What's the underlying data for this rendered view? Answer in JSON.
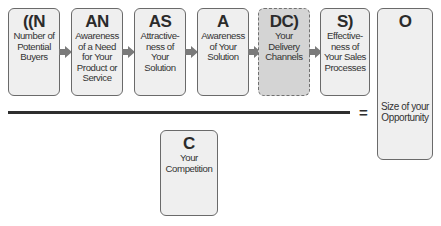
{
  "diagram": {
    "factors": [
      {
        "code": "((N",
        "desc": "Number of Potential Buyers",
        "style": "solid"
      },
      {
        "code": "AN",
        "desc": "Awareness of a Need for Your Product or Service",
        "style": "solid"
      },
      {
        "code": "AS",
        "desc": "Attractive-ness of Your Solution",
        "style": "solid"
      },
      {
        "code": "A",
        "desc": "Awareness of Your Solution",
        "style": "solid"
      },
      {
        "code": "DC)",
        "desc": "Your Delivery Channels",
        "style": "dashed"
      },
      {
        "code": "S)",
        "desc": "Effective-ness of Your Sales Processes",
        "style": "solid"
      }
    ],
    "result": {
      "code": "O",
      "desc": "Size of your Opportunity"
    },
    "denominator": {
      "code": "C",
      "desc": "Your Competition"
    },
    "operator": "=",
    "colors": {
      "box_fill": "#efefef",
      "dashed_fill": "#d4d4d4",
      "border": "#6a6a6a",
      "arrow": "#7a7a7a",
      "divider": "#2e2e2e"
    }
  }
}
